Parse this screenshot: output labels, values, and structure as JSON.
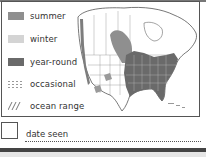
{
  "legend": {
    "items": [
      {
        "key": "summer",
        "label": "summer",
        "color": "#8f8f8f"
      },
      {
        "key": "winter",
        "label": "winter",
        "color": "#d4d4d4"
      },
      {
        "key": "year-round",
        "label": "year-round",
        "color": "#6a6a6a"
      },
      {
        "key": "occasional",
        "label": "occasional",
        "pattern": "dotted-grid"
      },
      {
        "key": "ocean-range",
        "label": "ocean range",
        "pattern": "diagonal-hatch"
      }
    ]
  },
  "map": {
    "region": "North America",
    "range_colors": {
      "summer": "#8f8f8f",
      "year_round": "#6a6a6a",
      "winter": "#d4d4d4"
    }
  },
  "checklist": {
    "date_label": "date seen"
  }
}
